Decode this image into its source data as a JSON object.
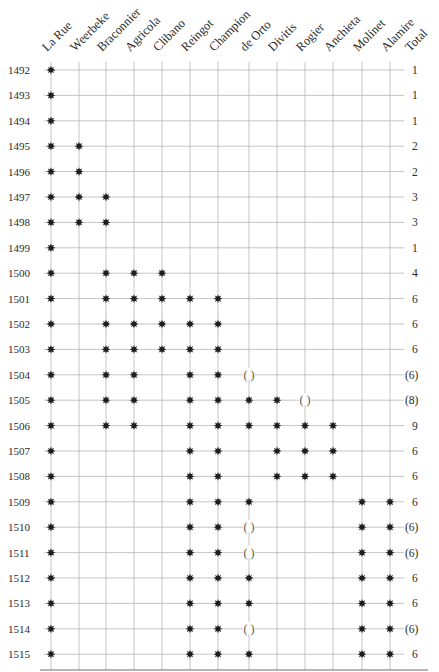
{
  "chart_data": {
    "type": "table",
    "title": "",
    "columns": [
      "La Rue",
      "Weerbeke",
      "Braconnier",
      "Agricola",
      "Clibano",
      "Reingot",
      "Champion",
      "de Orto",
      "Divitis",
      "Rogier",
      "Anchieta",
      "Molinet",
      "Alamire"
    ],
    "total_label": "Total",
    "legend": {
      "star": "present",
      "paren": "uncertain / ( )"
    },
    "rows": [
      {
        "year": "1492",
        "cells": [
          1,
          0,
          0,
          0,
          0,
          0,
          0,
          0,
          0,
          0,
          0,
          0,
          0
        ],
        "total": "1"
      },
      {
        "year": "1493",
        "cells": [
          1,
          0,
          0,
          0,
          0,
          0,
          0,
          0,
          0,
          0,
          0,
          0,
          0
        ],
        "total": "1"
      },
      {
        "year": "1494",
        "cells": [
          1,
          0,
          0,
          0,
          0,
          0,
          0,
          0,
          0,
          0,
          0,
          0,
          0
        ],
        "total": "1"
      },
      {
        "year": "1495",
        "cells": [
          1,
          1,
          0,
          0,
          0,
          0,
          0,
          0,
          0,
          0,
          0,
          0,
          0
        ],
        "total": "2"
      },
      {
        "year": "1496",
        "cells": [
          1,
          1,
          0,
          0,
          0,
          0,
          0,
          0,
          0,
          0,
          0,
          0,
          0
        ],
        "total": "2"
      },
      {
        "year": "1497",
        "cells": [
          1,
          1,
          1,
          0,
          0,
          0,
          0,
          0,
          0,
          0,
          0,
          0,
          0
        ],
        "total": "3"
      },
      {
        "year": "1498",
        "cells": [
          1,
          1,
          1,
          0,
          0,
          0,
          0,
          0,
          0,
          0,
          0,
          0,
          0
        ],
        "total": "3"
      },
      {
        "year": "1499",
        "cells": [
          1,
          0,
          0,
          0,
          0,
          0,
          0,
          0,
          0,
          0,
          0,
          0,
          0
        ],
        "total": "1"
      },
      {
        "year": "1500",
        "cells": [
          1,
          0,
          1,
          1,
          1,
          0,
          0,
          0,
          0,
          0,
          0,
          0,
          0
        ],
        "total": "4"
      },
      {
        "year": "1501",
        "cells": [
          1,
          0,
          1,
          1,
          1,
          1,
          1,
          0,
          0,
          0,
          0,
          0,
          0
        ],
        "total": "6"
      },
      {
        "year": "1502",
        "cells": [
          1,
          0,
          1,
          1,
          1,
          1,
          1,
          0,
          0,
          0,
          0,
          0,
          0
        ],
        "total": "6"
      },
      {
        "year": "1503",
        "cells": [
          1,
          0,
          1,
          1,
          1,
          1,
          1,
          0,
          0,
          0,
          0,
          0,
          0
        ],
        "total": "6"
      },
      {
        "year": "1504",
        "cells": [
          1,
          0,
          1,
          1,
          0,
          1,
          1,
          "p",
          0,
          0,
          0,
          0,
          0
        ],
        "total": "(6)"
      },
      {
        "year": "1505",
        "cells": [
          1,
          0,
          1,
          1,
          0,
          1,
          1,
          1,
          1,
          "p",
          0,
          0,
          0
        ],
        "total": "(8)"
      },
      {
        "year": "1506",
        "cells": [
          1,
          0,
          1,
          1,
          0,
          1,
          1,
          1,
          1,
          1,
          1,
          0,
          0
        ],
        "total": "9"
      },
      {
        "year": "1507",
        "cells": [
          1,
          0,
          0,
          0,
          0,
          1,
          1,
          0,
          1,
          1,
          1,
          0,
          0
        ],
        "total": "6"
      },
      {
        "year": "1508",
        "cells": [
          1,
          0,
          0,
          0,
          0,
          1,
          1,
          0,
          1,
          1,
          1,
          0,
          0
        ],
        "total": "6"
      },
      {
        "year": "1509",
        "cells": [
          1,
          0,
          0,
          0,
          0,
          1,
          1,
          1,
          0,
          0,
          0,
          1,
          1
        ],
        "total": "6"
      },
      {
        "year": "1510",
        "cells": [
          1,
          0,
          0,
          0,
          0,
          1,
          1,
          "p",
          0,
          0,
          0,
          1,
          1
        ],
        "total": "(6)"
      },
      {
        "year": "1511",
        "cells": [
          1,
          0,
          0,
          0,
          0,
          1,
          1,
          "p",
          0,
          0,
          0,
          1,
          1
        ],
        "total": "(6)"
      },
      {
        "year": "1512",
        "cells": [
          1,
          0,
          0,
          0,
          0,
          1,
          1,
          1,
          0,
          0,
          0,
          1,
          1
        ],
        "total": "6"
      },
      {
        "year": "1513",
        "cells": [
          1,
          0,
          0,
          0,
          0,
          1,
          1,
          1,
          0,
          0,
          0,
          1,
          1
        ],
        "total": "6"
      },
      {
        "year": "1514",
        "cells": [
          1,
          0,
          0,
          0,
          0,
          1,
          1,
          "p",
          0,
          0,
          0,
          1,
          1
        ],
        "total": "(6)"
      },
      {
        "year": "1515",
        "cells": [
          1,
          0,
          0,
          0,
          0,
          1,
          1,
          1,
          0,
          0,
          0,
          1,
          1
        ],
        "total": "6"
      }
    ],
    "paren_glyph": "( )",
    "grid": true
  },
  "colors": {
    "grid": "#b5b5b5",
    "marker": "#1e1e1e",
    "text": "#2b2b2b"
  }
}
